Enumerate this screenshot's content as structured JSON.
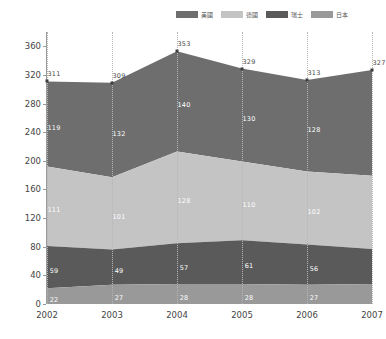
{
  "chart_data": {
    "type": "area",
    "stacked": true,
    "title": "",
    "xlabel": "",
    "ylabel": "",
    "categories": [
      "2002",
      "2003",
      "2004",
      "2005",
      "2006",
      "2007"
    ],
    "ylim": [
      0,
      380
    ],
    "yticks": [
      0,
      40,
      80,
      120,
      160,
      200,
      240,
      280,
      320,
      360
    ],
    "grid": "vertical-dotted",
    "legend_position": "top-right",
    "series": [
      {
        "name": "美國",
        "color": "#6e6e6e",
        "values": [
          119,
          132,
          140,
          130,
          128,
          148
        ]
      },
      {
        "name": "德國",
        "color": "#c4c4c4",
        "values": [
          111,
          101,
          128,
          110,
          102,
          102
        ]
      },
      {
        "name": "瑞士",
        "color": "#5a5a5a",
        "values": [
          59,
          49,
          57,
          61,
          56,
          49
        ]
      },
      {
        "name": "日本",
        "color": "#999999",
        "values": [
          22,
          27,
          28,
          28,
          27,
          28
        ]
      }
    ],
    "totals": [
      311,
      309,
      353,
      329,
      313,
      327
    ],
    "totals_shown": true
  },
  "legend": {
    "items": [
      {
        "label": "美國",
        "color": "#6e6e6e"
      },
      {
        "label": "德國",
        "color": "#c4c4c4"
      },
      {
        "label": "瑞士",
        "color": "#5a5a5a"
      },
      {
        "label": "日本",
        "color": "#999999"
      }
    ]
  }
}
